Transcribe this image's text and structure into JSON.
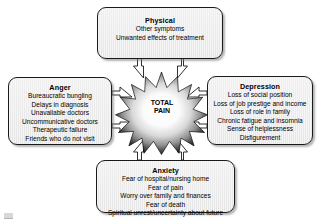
{
  "diagram": {
    "center": {
      "label_line1": "TOTAL",
      "label_line2": "PAIN",
      "shape": "starburst"
    },
    "colors": {
      "box_fill": "#ebebeb",
      "box_border": "#1a1a1a",
      "shadow": "#787878",
      "text": "#000000",
      "star_edge": "#111111",
      "star_center": "#ffffff",
      "background": "#ffffff"
    },
    "boxes": [
      {
        "id": "physical",
        "title": "Physical",
        "position": "top",
        "items": [
          "Other symptoms",
          "Unwanted effects of treatment"
        ]
      },
      {
        "id": "anger",
        "title": "Anger",
        "position": "left",
        "items": [
          "Bureaucratic bungling",
          "Delays in diagnosis",
          "Unavailable doctors",
          "Uncommunicative doctors",
          "Therapeutic failure",
          "Friends who do not visit"
        ]
      },
      {
        "id": "depression",
        "title": "Depression",
        "position": "right",
        "items": [
          "Loss of social position",
          "Loss of job prestige and income",
          "Loss of role in family",
          "Chronic fatigue and insomnia",
          "Sense of helplessness",
          "Disfigurement"
        ]
      },
      {
        "id": "anxiety",
        "title": "Anxiety",
        "position": "bottom",
        "items": [
          "Fear of hospital/nursing home",
          "Fear of pain",
          "Worry over family and finances",
          "Fear of death",
          "Spiritual unrest/uncertainty about future"
        ]
      }
    ],
    "connectors": [
      {
        "from": "physical",
        "to": "center",
        "direction": "down",
        "count": 2,
        "style": "outlined-arrow"
      },
      {
        "from": "anger",
        "to": "center",
        "direction": "right",
        "count": 2,
        "style": "outlined-arrow"
      },
      {
        "from": "depression",
        "to": "center",
        "direction": "left",
        "count": 2,
        "style": "outlined-arrow"
      },
      {
        "from": "anxiety",
        "to": "center",
        "direction": "up",
        "count": 2,
        "style": "outlined-arrow"
      }
    ]
  }
}
